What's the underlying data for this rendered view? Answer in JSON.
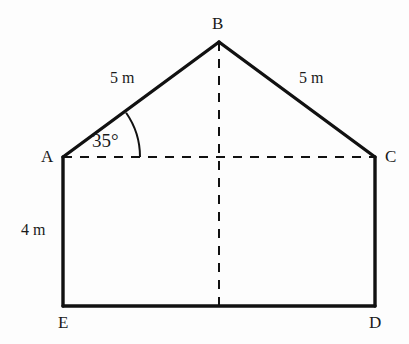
{
  "figure": {
    "background_color": "#fdfdfd",
    "stroke_color": "#111111",
    "solid_stroke_width": 3,
    "dashed_stroke_width": 2,
    "dash_pattern": "9 8",
    "canvas": {
      "width": 409,
      "height": 344
    }
  },
  "vertices": {
    "A": {
      "label": "A",
      "x": 63,
      "y": 157,
      "label_x": 41,
      "label_y": 148
    },
    "B": {
      "label": "B",
      "x": 219,
      "y": 42,
      "label_x": 212,
      "label_y": 15
    },
    "C": {
      "label": "C",
      "x": 375,
      "y": 157,
      "label_x": 385,
      "label_y": 148
    },
    "D": {
      "label": "D",
      "x": 375,
      "y": 306,
      "label_x": 369,
      "label_y": 314
    },
    "E": {
      "label": "E",
      "x": 63,
      "y": 306,
      "label_x": 58,
      "label_y": 314
    }
  },
  "edges": {
    "roof_left": {
      "name": "A-B",
      "style": "solid",
      "from": "A",
      "to": "B"
    },
    "roof_right": {
      "name": "B-C",
      "style": "solid",
      "from": "B",
      "to": "C"
    },
    "wall_left": {
      "name": "A-E",
      "style": "solid",
      "from": "A",
      "to": "E"
    },
    "wall_right": {
      "name": "C-D",
      "style": "solid",
      "from": "C",
      "to": "D"
    },
    "floor": {
      "name": "E-D",
      "style": "solid",
      "from": "E",
      "to": "D"
    },
    "base_ac": {
      "name": "A-C",
      "style": "dashed",
      "from": "A",
      "to": "C"
    },
    "axis_vertical": {
      "name": "B-floor",
      "style": "dashed",
      "x": 219,
      "y1": 42,
      "y2": 306
    }
  },
  "angle_arc": {
    "at_vertex": "A",
    "label": "35°",
    "value": 35,
    "unit": "degrees",
    "radius": 77,
    "label_x": 92,
    "label_y": 131
  },
  "measurements": [
    {
      "name": "roof-left-length",
      "label": "5 m",
      "value": 5,
      "unit": "m",
      "x": 110,
      "y": 70,
      "edge": "A-B"
    },
    {
      "name": "roof-right-length",
      "label": "5 m",
      "value": 5,
      "unit": "m",
      "x": 299,
      "y": 70,
      "edge": "B-C"
    },
    {
      "name": "wall-left-height",
      "label": "4 m",
      "value": 4,
      "unit": "m",
      "x": 21,
      "y": 222,
      "edge": "A-E"
    }
  ]
}
